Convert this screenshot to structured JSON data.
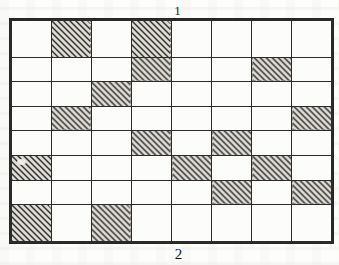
{
  "figure": {
    "kind": "hatched-lattice-grid",
    "top_label": "1",
    "bottom_label": "2",
    "rows": 8,
    "columns": 8,
    "total_cells": 64,
    "shaded_cell_count": 16,
    "unshaded_cell_count": 48,
    "fill_style": "diagonal-hatch-45deg",
    "colors": {
      "paper": "#fdfdfb",
      "cell_background": "#fcfcfa",
      "grid_line": "#2b2b2b",
      "hatch_line": "#2e2e2e",
      "hatch_background": "#dedad4",
      "label_text": "#1c1c1c"
    }
  },
  "chart_data": {
    "type": "heatmap",
    "title": "",
    "subtitle": "",
    "xlabel": "2",
    "ylabel": "",
    "top_annotation": "1",
    "grid": true,
    "legend": "none",
    "rows": 8,
    "columns": 8,
    "row_labels": [
      "1",
      "2",
      "3",
      "4",
      "5",
      "6",
      "7",
      "8"
    ],
    "column_labels": [
      "1",
      "2",
      "3",
      "4",
      "5",
      "6",
      "7",
      "8"
    ],
    "value_map": {
      "0": "unshaded",
      "1": "hatched"
    },
    "values": [
      [
        0,
        1,
        0,
        1,
        0,
        0,
        0,
        0
      ],
      [
        0,
        0,
        0,
        1,
        0,
        0,
        1,
        0
      ],
      [
        0,
        0,
        1,
        0,
        0,
        0,
        0,
        0
      ],
      [
        0,
        1,
        0,
        0,
        0,
        0,
        0,
        1
      ],
      [
        0,
        0,
        0,
        1,
        0,
        1,
        0,
        0
      ],
      [
        1,
        0,
        0,
        0,
        1,
        0,
        1,
        0
      ],
      [
        0,
        0,
        0,
        0,
        0,
        1,
        0,
        1
      ],
      [
        1,
        0,
        1,
        0,
        0,
        0,
        0,
        0
      ]
    ],
    "shaded_cells": [
      {
        "row": 1,
        "col": 2
      },
      {
        "row": 1,
        "col": 4
      },
      {
        "row": 2,
        "col": 4
      },
      {
        "row": 2,
        "col": 7
      },
      {
        "row": 3,
        "col": 3
      },
      {
        "row": 4,
        "col": 2
      },
      {
        "row": 4,
        "col": 8
      },
      {
        "row": 5,
        "col": 4
      },
      {
        "row": 5,
        "col": 6
      },
      {
        "row": 6,
        "col": 1
      },
      {
        "row": 6,
        "col": 5
      },
      {
        "row": 6,
        "col": 7
      },
      {
        "row": 7,
        "col": 6
      },
      {
        "row": 7,
        "col": 8
      },
      {
        "row": 8,
        "col": 1
      },
      {
        "row": 8,
        "col": 3
      }
    ],
    "row_shaded_counts": [
      2,
      2,
      1,
      2,
      2,
      3,
      2,
      2
    ],
    "column_shaded_counts": [
      2,
      2,
      2,
      3,
      1,
      2,
      2,
      2
    ]
  }
}
